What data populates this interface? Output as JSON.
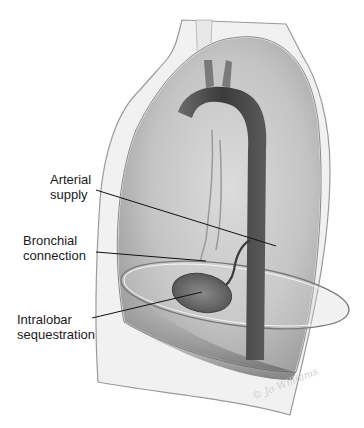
{
  "figure": {
    "type": "anatomical-illustration",
    "labels": [
      {
        "id": "arterial-supply",
        "text": "Arterial\nsupply",
        "x": 50,
        "y": 172,
        "target_x": 276,
        "target_y": 246
      },
      {
        "id": "bronchial-connection",
        "text": "Bronchial\nconnection",
        "x": 23,
        "y": 233,
        "target_x": 206,
        "target_y": 261
      },
      {
        "id": "intralobar-sequestration",
        "text": "Intralobar\nsequestration",
        "x": 17,
        "y": 312,
        "target_x": 202,
        "target_y": 292
      }
    ],
    "signature": "© Jo Williams",
    "colors": {
      "background": "#ffffff",
      "lung_fill": "#b9b9b9",
      "lung_outline": "#8a8a8a",
      "aorta": "#4a4a4a",
      "sequestration": "#6a6a6a",
      "leader_line": "#111111",
      "label_text": "#1a1a1a"
    }
  }
}
